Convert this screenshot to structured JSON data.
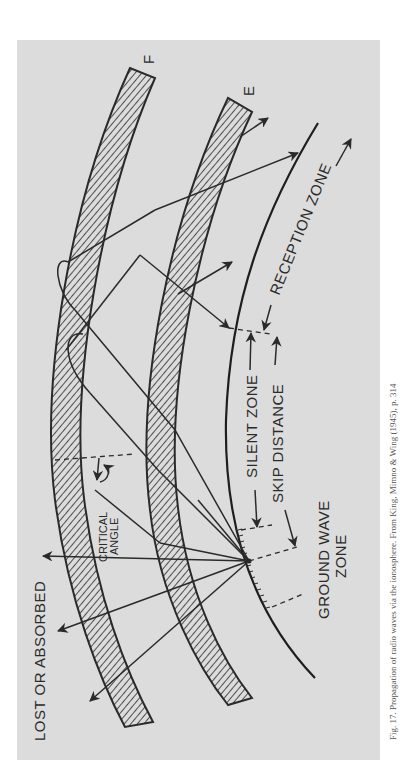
{
  "figure": {
    "layers": [
      {
        "id": "F",
        "label": "F"
      },
      {
        "id": "E",
        "label": "E"
      }
    ],
    "labels": {
      "lost_or_absorbed": "LOST OR ABSORBED",
      "critical_angle_line1": "CRITICAL",
      "critical_angle_line2": "ANGLE",
      "silent_zone": "SILENT ZONE",
      "skip_distance": "SKIP DISTANCE",
      "reception_zone": "RECEPTION ZONE",
      "ground_wave_line1": "GROUND WAVE",
      "ground_wave_line2": "ZONE"
    },
    "caption": "Fig. 17. Propagation of radio waves via the ionosphere. From King, Mimno & Wing (1945), p. 314",
    "colors": {
      "panel": "#dcdcdc",
      "ink": "#2a2a2a",
      "page": "#ffffff"
    }
  }
}
